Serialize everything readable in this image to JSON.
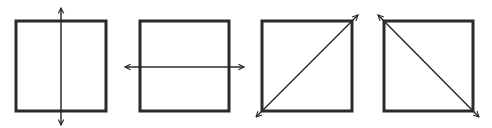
{
  "diagram": {
    "colors": {
      "stroke": "#2a2a2a",
      "background": "#ffffff"
    },
    "figures": [
      {
        "id": "vertical",
        "square": {
          "x": 16,
          "y": 21,
          "w": 90,
          "h": 90
        },
        "arrow": {
          "x1": 61,
          "y1": 125,
          "x2": 61,
          "y2": 8
        },
        "label": "vertical line of symmetry"
      },
      {
        "id": "horizontal",
        "square": {
          "x": 140,
          "y": 21,
          "w": 89,
          "h": 90
        },
        "arrow": {
          "x1": 125,
          "y1": 67,
          "x2": 244,
          "y2": 67
        },
        "label": "horizontal line of symmetry"
      },
      {
        "id": "diagonal-up",
        "square": {
          "x": 262,
          "y": 21,
          "w": 90,
          "h": 90
        },
        "arrow": {
          "x1": 256,
          "y1": 117,
          "x2": 358,
          "y2": 15
        },
        "label": "diagonal line of symmetry (bottom-left to top-right)"
      },
      {
        "id": "diagonal-down",
        "square": {
          "x": 384,
          "y": 21,
          "w": 89,
          "h": 90
        },
        "arrow": {
          "x1": 378,
          "y1": 15,
          "x2": 479,
          "y2": 117
        },
        "label": "diagonal line of symmetry (top-left to bottom-right)"
      }
    ]
  }
}
